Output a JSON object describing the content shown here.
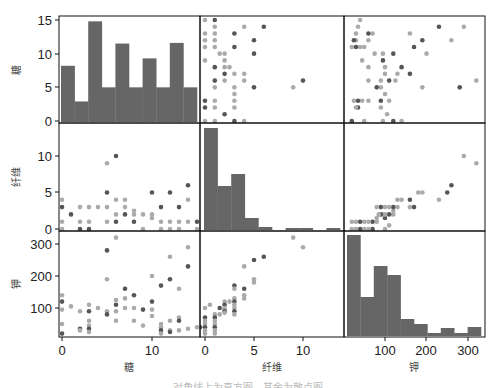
{
  "chart_data": {
    "type": "scatter_matrix",
    "title": "",
    "variables": [
      "糖",
      "纤维",
      "钾"
    ],
    "colors": {
      "bar": "#666666",
      "dot_dark": "#555555",
      "dot_light": "#aaaaaa",
      "frame": "#111111",
      "background": "#ffffff"
    },
    "layout": {
      "cols_x": [
        [
          59,
          200
        ],
        [
          200,
          344
        ],
        [
          344,
          485
        ]
      ],
      "rows_y": [
        [
          16,
          123
        ],
        [
          123,
          231
        ],
        [
          231,
          337
        ]
      ]
    },
    "axes": {
      "糖": {
        "ticks": [
          0,
          5,
          10,
          15
        ],
        "x_ticks": [
          0,
          10
        ],
        "range": [
          0,
          15
        ]
      },
      "纤维": {
        "ticks": [
          0,
          5,
          10
        ],
        "x_ticks": [
          0,
          5,
          10
        ],
        "range": [
          0,
          14
        ]
      },
      "钾": {
        "ticks": [
          100,
          200,
          300
        ],
        "x_ticks": [
          100,
          200,
          300
        ],
        "range": [
          15,
          330
        ]
      }
    },
    "y_tick_pixels": {
      "row0": [
        {
          "label": "0",
          "y": 121
        },
        {
          "label": "5",
          "y": 87
        },
        {
          "label": "10",
          "y": 54
        },
        {
          "label": "15",
          "y": 20
        }
      ],
      "row1": [
        {
          "label": "0",
          "y": 229
        },
        {
          "label": "5",
          "y": 192
        },
        {
          "label": "10",
          "y": 156
        }
      ],
      "row2": [
        {
          "label": "100",
          "y": 308
        },
        {
          "label": "200",
          "y": 276
        },
        {
          "label": "300",
          "y": 244
        }
      ]
    },
    "x_tick_pixels": {
      "col0": [
        {
          "label": "0",
          "x": 62
        },
        {
          "label": "10",
          "x": 152
        }
      ],
      "col1": [
        {
          "label": "0",
          "x": 205
        },
        {
          "label": "5",
          "x": 254
        },
        {
          "label": "10",
          "x": 303
        }
      ],
      "col2": [
        {
          "label": "100",
          "x": 385
        },
        {
          "label": "200",
          "x": 426
        },
        {
          "label": "300",
          "x": 468
        }
      ]
    },
    "histograms": {
      "糖": {
        "bins_x": [
          61,
          197
        ],
        "counts_in_y_units": [
          8.2,
          2.9,
          14.8,
          5,
          11.5,
          5,
          9.3,
          5,
          11.6,
          5
        ]
      },
      "纤维": {
        "bar_tops_px": [
          128,
          186,
          174,
          218,
          227,
          231,
          228,
          228,
          231,
          228
        ],
        "bins_x": [
          204,
          340
        ]
      },
      "钾": {
        "bar_tops_px": [
          235,
          297,
          266,
          275,
          319,
          324,
          333,
          328,
          333,
          327
        ],
        "bins_x": [
          347,
          481
        ]
      }
    },
    "scatter": {
      "糖_vs_纤维": [
        [
          0,
          4
        ],
        [
          0,
          3
        ],
        [
          0,
          1
        ],
        [
          0,
          0
        ],
        [
          1,
          2
        ],
        [
          2,
          3
        ],
        [
          2,
          1
        ],
        [
          2,
          0
        ],
        [
          3,
          3
        ],
        [
          3,
          1
        ],
        [
          3,
          0
        ],
        [
          4,
          3
        ],
        [
          5,
          9
        ],
        [
          5,
          5
        ],
        [
          5,
          3
        ],
        [
          5,
          1
        ],
        [
          6,
          10
        ],
        [
          6,
          4
        ],
        [
          6,
          2
        ],
        [
          6,
          1
        ],
        [
          7,
          4
        ],
        [
          7,
          3
        ],
        [
          7,
          2
        ],
        [
          8,
          2.5
        ],
        [
          8,
          2
        ],
        [
          8,
          1
        ],
        [
          9,
          0
        ],
        [
          9,
          2
        ],
        [
          10,
          5
        ],
        [
          10,
          2
        ],
        [
          10,
          1.5
        ],
        [
          11,
          3
        ],
        [
          11,
          1
        ],
        [
          11,
          0
        ],
        [
          12,
          5
        ],
        [
          12,
          1
        ],
        [
          12,
          0
        ],
        [
          13,
          3
        ],
        [
          13,
          1
        ],
        [
          13,
          0
        ],
        [
          14,
          6
        ],
        [
          14,
          4
        ],
        [
          14,
          1
        ],
        [
          15,
          1
        ],
        [
          15,
          0
        ]
      ],
      "糖_vs_钾": [
        [
          0,
          140
        ],
        [
          0,
          120
        ],
        [
          0,
          95
        ],
        [
          0,
          50
        ],
        [
          0,
          20
        ],
        [
          1,
          105
        ],
        [
          2,
          90
        ],
        [
          2,
          35
        ],
        [
          2,
          30
        ],
        [
          3,
          110
        ],
        [
          3,
          90
        ],
        [
          3,
          60
        ],
        [
          3,
          45
        ],
        [
          3,
          35
        ],
        [
          3,
          25
        ],
        [
          4,
          100
        ],
        [
          5,
          280
        ],
        [
          5,
          190
        ],
        [
          5,
          90
        ],
        [
          5,
          80
        ],
        [
          6,
          320
        ],
        [
          6,
          125
        ],
        [
          6,
          110
        ],
        [
          6,
          90
        ],
        [
          6,
          60
        ],
        [
          7,
          160
        ],
        [
          7,
          130
        ],
        [
          7,
          100
        ],
        [
          8,
          140
        ],
        [
          8,
          100
        ],
        [
          8,
          60
        ],
        [
          9,
          95
        ],
        [
          9,
          45
        ],
        [
          10,
          200
        ],
        [
          10,
          120
        ],
        [
          10,
          95
        ],
        [
          10,
          75
        ],
        [
          11,
          170
        ],
        [
          11,
          50
        ],
        [
          11,
          40
        ],
        [
          11,
          30
        ],
        [
          11,
          20
        ],
        [
          12,
          260
        ],
        [
          12,
          190
        ],
        [
          12,
          60
        ],
        [
          12,
          30
        ],
        [
          12,
          25
        ],
        [
          13,
          160
        ],
        [
          13,
          70
        ],
        [
          13,
          60
        ],
        [
          13,
          30
        ],
        [
          14,
          290
        ],
        [
          14,
          230
        ],
        [
          14,
          35
        ],
        [
          15,
          40
        ]
      ],
      "纤维_vs_钾": [
        [
          0,
          100
        ],
        [
          0,
          70
        ],
        [
          0,
          60
        ],
        [
          0,
          50
        ],
        [
          0,
          40
        ],
        [
          0,
          30
        ],
        [
          0,
          20
        ],
        [
          -0.5,
          40
        ],
        [
          0.5,
          110
        ],
        [
          1,
          80
        ],
        [
          1,
          70
        ],
        [
          1,
          60
        ],
        [
          1,
          50
        ],
        [
          1,
          40
        ],
        [
          1,
          30
        ],
        [
          1,
          20
        ],
        [
          1.5,
          100
        ],
        [
          1.5,
          80
        ],
        [
          2,
          120
        ],
        [
          2,
          110
        ],
        [
          2,
          100
        ],
        [
          2,
          95
        ],
        [
          2,
          90
        ],
        [
          2,
          85
        ],
        [
          2.5,
          120
        ],
        [
          3,
          170
        ],
        [
          3,
          160
        ],
        [
          3,
          130
        ],
        [
          3,
          120
        ],
        [
          3,
          110
        ],
        [
          3,
          100
        ],
        [
          3,
          90
        ],
        [
          3,
          80
        ],
        [
          4,
          230
        ],
        [
          4,
          160
        ],
        [
          4,
          140
        ],
        [
          4,
          130
        ],
        [
          5,
          250
        ],
        [
          5,
          190
        ],
        [
          5,
          180
        ],
        [
          6,
          260
        ],
        [
          9,
          320
        ],
        [
          10,
          290
        ]
      ],
      "钾_vs_糖": "mirror of 糖_vs_钾",
      "钾_vs_纤维": "mirror of 纤维_vs_钾",
      "纤维_vs_糖": "mirror of 糖_vs_纤维"
    },
    "xlabels": [
      "糖",
      "纤维",
      "钾"
    ],
    "ylabels": [
      "糖",
      "纤维",
      "钾"
    ],
    "legend": null,
    "grid": false
  },
  "labels": {
    "x_axis": [
      "糖",
      "纤维",
      "钾"
    ],
    "y_axis": [
      "糖",
      "纤维",
      "钾"
    ],
    "caption": "……对角线上为直方图，其余为散点图……"
  }
}
